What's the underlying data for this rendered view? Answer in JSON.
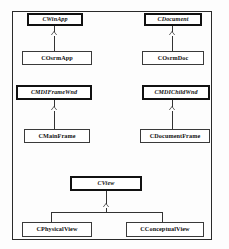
{
  "diagram": {
    "type": "uml-class-diagram",
    "notation": "generalization",
    "colors": {
      "box_fill": "#ffffff",
      "base_border": "#111111",
      "derived_border": "#3a3a3a",
      "connector": "#333333",
      "frame_border": "#2a2a2a"
    },
    "classes": [
      {
        "id": "cwinapp",
        "label": "CWinApp",
        "kind": "base",
        "style": "italic"
      },
      {
        "id": "cosrmapp",
        "label": "COsrmApp",
        "kind": "derived",
        "style": "normal"
      },
      {
        "id": "cdocument",
        "label": "CDocument",
        "kind": "base",
        "style": "italic"
      },
      {
        "id": "cosrmdoc",
        "label": "COsrmDoc",
        "kind": "derived",
        "style": "normal"
      },
      {
        "id": "cmdiframewnd",
        "label": "CMDIFrameWnd",
        "kind": "base",
        "style": "italic"
      },
      {
        "id": "cmainframe",
        "label": "CMainFrame",
        "kind": "derived",
        "style": "normal"
      },
      {
        "id": "cmdichildwnd",
        "label": "CMDIChildWnd",
        "kind": "base",
        "style": "italic"
      },
      {
        "id": "cdocumentframe",
        "label": "CDocumentFrame",
        "kind": "derived",
        "style": "normal"
      },
      {
        "id": "cview",
        "label": "CView",
        "kind": "base",
        "style": "italic"
      },
      {
        "id": "cphysicalview",
        "label": "CPhysicalView",
        "kind": "derived",
        "style": "normal"
      },
      {
        "id": "cconceptualview",
        "label": "CConceptualView",
        "kind": "derived",
        "style": "normal"
      }
    ],
    "generalizations": [
      {
        "child": "cosrmapp",
        "parent": "cwinapp"
      },
      {
        "child": "cosrmdoc",
        "parent": "cdocument"
      },
      {
        "child": "cmainframe",
        "parent": "cmdiframewnd"
      },
      {
        "child": "cdocumentframe",
        "parent": "cmdichildwnd"
      },
      {
        "child": "cphysicalview",
        "parent": "cview"
      },
      {
        "child": "cconceptualview",
        "parent": "cview"
      }
    ]
  }
}
